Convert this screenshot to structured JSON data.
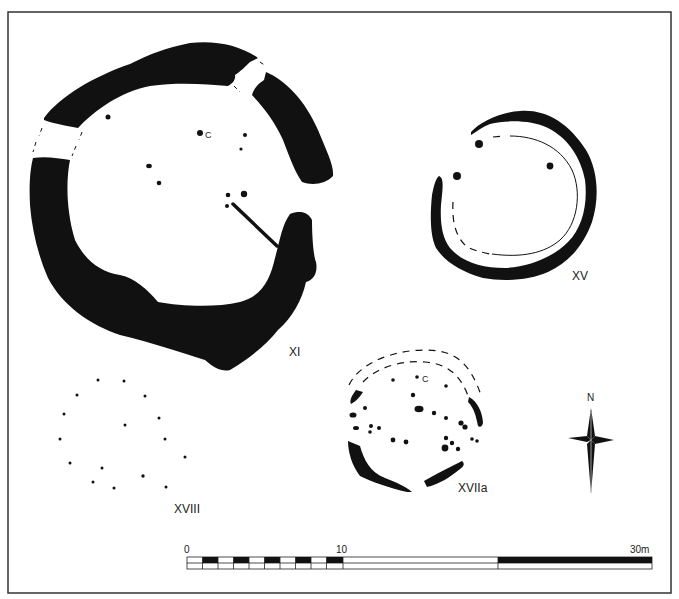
{
  "figure": {
    "type": "archaeological site plan",
    "frame_color": "#333333",
    "ink_color": "#111111"
  },
  "structures": [
    {
      "id": "XI",
      "label": "XI",
      "description": "large penannular ring ditch with two causeway gaps and post holes",
      "post_hole_center_label": "C"
    },
    {
      "id": "XV",
      "label": "XV",
      "description": "penannular ring ditch with inner gully"
    },
    {
      "id": "XVIIa",
      "label": "XVIIa",
      "description": "post-hole ring with ditch segments",
      "post_hole_center_label": "C"
    },
    {
      "id": "XVIII",
      "label": "XVIII",
      "description": "post-hole ring"
    }
  ],
  "north_arrow": {
    "label": "N"
  },
  "scale_bar": {
    "labels": [
      "0",
      "10",
      "30m"
    ],
    "ticks_m": [
      0,
      10,
      30
    ],
    "unit": "m"
  }
}
